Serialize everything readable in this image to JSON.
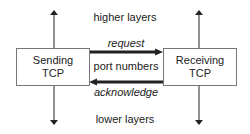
{
  "diagram": {
    "layers": {
      "higher": "higher layers",
      "lower": "lower layers"
    },
    "nodes": [
      {
        "id": "sending",
        "line1": "Sending",
        "line2": "TCP"
      },
      {
        "id": "receiving",
        "line1": "Receiving",
        "line2": "TCP"
      }
    ],
    "channel_label": "port numbers",
    "edges": [
      {
        "from": "sending",
        "to": "receiving",
        "label": "request"
      },
      {
        "from": "receiving",
        "to": "sending",
        "label": "acknowledge"
      }
    ],
    "colors": {
      "line": "#222222",
      "box_border": "#777777",
      "text": "#222222"
    }
  }
}
